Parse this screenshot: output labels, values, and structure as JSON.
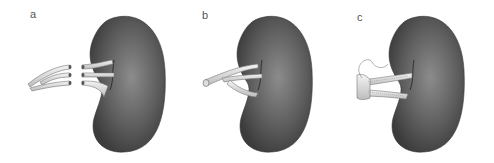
{
  "figure": {
    "panels": [
      {
        "label": "a",
        "description": "Kidney with three separate renal vessel stumps and three separate donor vessel ends"
      },
      {
        "label": "b",
        "description": "Kidney with branching vessels joined into a single trunk"
      },
      {
        "label": "c",
        "description": "Kidney with vessels joined via sutured patch anastomosis"
      }
    ]
  },
  "colors": {
    "kidney_dark": "#4a4a4a",
    "kidney_light": "#8a8a8a",
    "vessel": "#e8e8e8",
    "vessel_outline": "#7a7a7a",
    "background": "#ffffff"
  }
}
